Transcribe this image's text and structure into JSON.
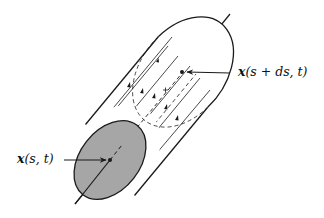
{
  "diagram": {
    "type": "flux-tube",
    "colors": {
      "stroke": "#1a1a1a",
      "cap_fill": "#a6a6a6",
      "background": "#ffffff"
    },
    "labels": {
      "front_point": {
        "vec": "x",
        "args": "(s, t)"
      },
      "back_point": {
        "vec": "x",
        "args": "(s + ds, t)"
      }
    },
    "axis": {
      "x1": 75,
      "y1": 204,
      "x2": 230,
      "y2": 14
    },
    "front_cap": {
      "cx": 110,
      "cy": 160,
      "rx": 30,
      "ry": 44,
      "rotate": 38
    },
    "back_cap": {
      "cx": 183,
      "cy": 72,
      "rx": 30,
      "ry": 44,
      "rotate": 38
    }
  }
}
